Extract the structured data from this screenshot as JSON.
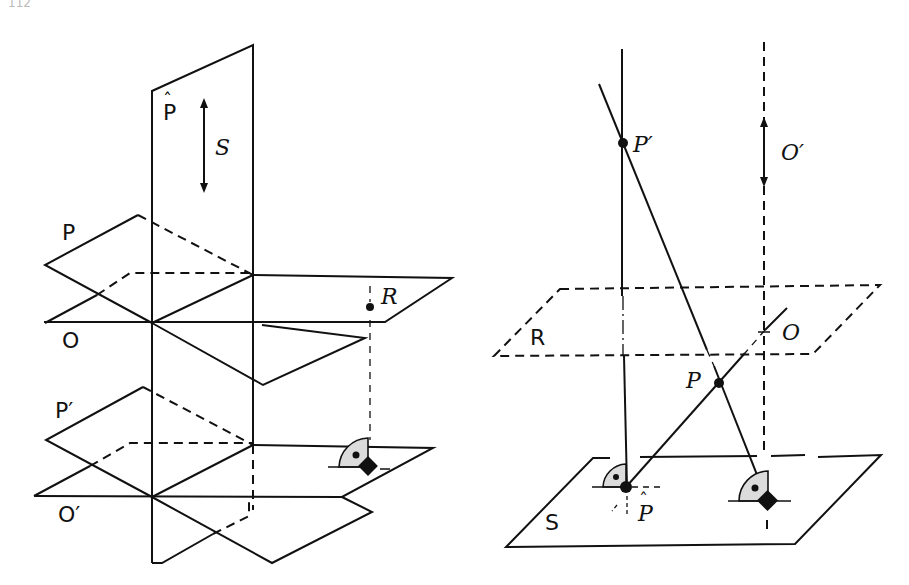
{
  "page_number": "112",
  "left_figure": {
    "vertical_plane_label": "P̂",
    "vertical_plane_hat": "ˆ",
    "vertical_plane_letter": "P",
    "arrow_label": "S",
    "plane_labels": [
      "P",
      "O",
      "P′",
      "O′"
    ],
    "point_label": "R"
  },
  "right_figure": {
    "labels": {
      "p_prime": "P′",
      "o_prime": "O′",
      "plane_r": "R",
      "o": "O",
      "p": "P",
      "plane_s": "S",
      "p_hat_letter": "P",
      "p_hat_hat": "ˆ"
    }
  },
  "colors": {
    "line": "#111111",
    "right_angle_fill": "#dcdcdc",
    "background": "#ffffff"
  }
}
